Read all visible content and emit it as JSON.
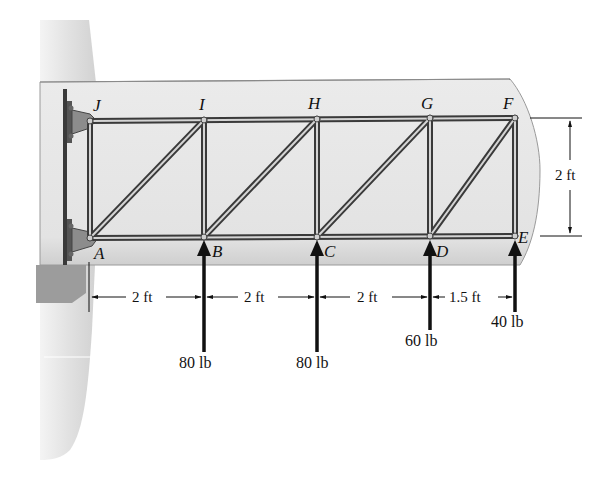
{
  "diagram": {
    "type": "truss",
    "joints": {
      "top": [
        {
          "name": "J",
          "x": 90
        },
        {
          "name": "I",
          "x": 204
        },
        {
          "name": "H",
          "x": 317
        },
        {
          "name": "G",
          "x": 430
        },
        {
          "name": "F",
          "x": 515
        }
      ],
      "bottom": [
        {
          "name": "A",
          "x": 90
        },
        {
          "name": "B",
          "x": 204
        },
        {
          "name": "C",
          "x": 317
        },
        {
          "name": "D",
          "x": 430
        },
        {
          "name": "E",
          "x": 515
        }
      ]
    },
    "labels": {
      "J": "J",
      "I": "I",
      "H": "H",
      "G": "G",
      "F": "F",
      "A": "A",
      "B": "B",
      "C": "C",
      "D": "D",
      "E": "E"
    },
    "spacing_dimensions": [
      {
        "label": "2 ft",
        "from": "A",
        "to": "B"
      },
      {
        "label": "2 ft",
        "from": "B",
        "to": "C"
      },
      {
        "label": "2 ft",
        "from": "C",
        "to": "D"
      },
      {
        "label": "1.5 ft",
        "from": "D",
        "to": "E"
      }
    ],
    "height_dimension": {
      "label": "2 ft",
      "from": "F",
      "to": "E"
    },
    "loads": [
      {
        "joint": "B",
        "label": "80 lb",
        "direction": "up"
      },
      {
        "joint": "C",
        "label": "80 lb",
        "direction": "up"
      },
      {
        "joint": "D",
        "label": "60 lb",
        "direction": "up"
      },
      {
        "joint": "E",
        "label": "40 lb",
        "direction": "up"
      }
    ],
    "colors": {
      "member": "#3a3a3a",
      "member_fill": "#d8d8d8",
      "wing": "#e6e6e6",
      "fuselage": "#ececec",
      "shadow": "#9a9a9a",
      "ink": "#111111"
    }
  }
}
